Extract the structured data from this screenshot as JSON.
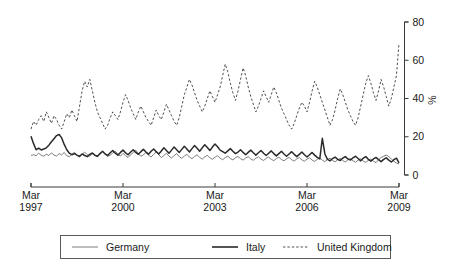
{
  "chart_data": {
    "type": "line",
    "title": "",
    "subtitle": "",
    "xlabel": "",
    "ylabel": "%",
    "ylim": [
      0,
      80
    ],
    "yticks": [
      0,
      20,
      40,
      60,
      80
    ],
    "ytick_labels": [
      "0",
      "20",
      "40",
      "60",
      "80"
    ],
    "xtick_labels": [
      "Mar\n1997",
      "Mar\n2000",
      "Mar\n2003",
      "Mar\n2006",
      "Mar\n2009"
    ],
    "xticks": [
      {
        "line1": "Mar",
        "line2": "1997",
        "index": 0
      },
      {
        "line1": "Mar",
        "line2": "2000",
        "index": 36
      },
      {
        "line1": "Mar",
        "line2": "2003",
        "index": 72
      },
      {
        "line1": "Mar",
        "line2": "2006",
        "index": 108
      },
      {
        "line1": "Mar",
        "line2": "2009",
        "index": 144
      }
    ],
    "x_start": "Mar 1997",
    "x_end": "Mar 2009",
    "x_frequency": "monthly",
    "n_points": 145,
    "grid": false,
    "legend_position": "bottom",
    "series": [
      {
        "name": "Germany",
        "color": "#6e6e6e",
        "style": "solid",
        "width": 0.9,
        "values": [
          10.2,
          10.6,
          10.1,
          11.4,
          10.3,
          9.8,
          10.9,
          10.2,
          11.6,
          10.4,
          9.9,
          11.2,
          10.5,
          11.8,
          10.1,
          9.6,
          10.8,
          11.9,
          10.3,
          9.4,
          10.7,
          12.0,
          10.6,
          9.8,
          11.1,
          10.2,
          9.5,
          10.9,
          12.2,
          11.0,
          9.7,
          10.4,
          11.5,
          12.4,
          10.8,
          9.9,
          11.3,
          10.1,
          9.2,
          10.6,
          11.8,
          13.0,
          11.2,
          9.8,
          10.5,
          11.9,
          10.3,
          9.4,
          10.8,
          12.1,
          10.6,
          9.1,
          10.2,
          11.4,
          9.8,
          8.9,
          10.1,
          11.2,
          9.6,
          8.7,
          9.9,
          10.8,
          9.4,
          8.5,
          9.7,
          10.5,
          9.2,
          8.3,
          9.5,
          10.3,
          9.0,
          8.2,
          9.3,
          10.1,
          8.8,
          8.0,
          9.1,
          9.9,
          8.6,
          7.9,
          9.0,
          9.7,
          8.5,
          7.8,
          8.9,
          9.6,
          8.4,
          7.7,
          8.8,
          9.5,
          8.3,
          7.6,
          8.7,
          9.4,
          8.2,
          7.5,
          8.6,
          9.3,
          8.1,
          7.4,
          8.5,
          9.2,
          8.0,
          7.3,
          8.4,
          9.1,
          7.9,
          7.2,
          8.3,
          9.0,
          7.8,
          7.1,
          8.2,
          8.9,
          7.7,
          7.0,
          8.1,
          8.8,
          7.6,
          6.9,
          8.0,
          8.7,
          7.5,
          6.8,
          7.9,
          8.6,
          7.4,
          6.7,
          7.8,
          8.5,
          7.3,
          6.6,
          7.7,
          8.4,
          7.2,
          6.5,
          8.0,
          9.2,
          9.8,
          10.4,
          9.6,
          8.4,
          7.2,
          6.2,
          5.8
        ]
      },
      {
        "name": "Italy",
        "color": "#2a2a2a",
        "style": "solid",
        "width": 1.5,
        "values": [
          20.2,
          16.4,
          13.2,
          14.0,
          13.1,
          13.6,
          14.2,
          15.6,
          17.4,
          19.0,
          20.6,
          21.2,
          19.4,
          16.0,
          13.2,
          11.4,
          10.6,
          11.2,
          10.4,
          9.8,
          11.0,
          10.2,
          9.6,
          10.8,
          11.5,
          10.4,
          9.8,
          11.2,
          12.4,
          11.0,
          10.2,
          11.6,
          12.8,
          11.4,
          10.4,
          11.8,
          13.0,
          11.6,
          10.6,
          12.0,
          13.2,
          11.8,
          10.8,
          12.2,
          13.4,
          12.0,
          10.9,
          12.4,
          13.6,
          12.2,
          11.0,
          12.6,
          14.2,
          12.8,
          11.4,
          13.0,
          14.6,
          13.2,
          11.8,
          13.4,
          15.0,
          13.6,
          12.0,
          13.8,
          15.4,
          14.0,
          12.4,
          14.2,
          15.8,
          14.4,
          12.8,
          14.6,
          16.2,
          14.8,
          13.0,
          12.2,
          11.4,
          12.6,
          13.8,
          12.4,
          11.2,
          12.0,
          13.2,
          11.8,
          10.6,
          11.8,
          13.0,
          11.6,
          10.4,
          11.6,
          12.8,
          11.4,
          10.2,
          11.4,
          12.6,
          11.2,
          10.0,
          11.2,
          12.4,
          11.0,
          9.8,
          11.0,
          12.2,
          10.8,
          9.6,
          10.8,
          12.0,
          10.6,
          9.4,
          10.6,
          11.8,
          10.4,
          9.2,
          8.4,
          19.2,
          11.0,
          8.2,
          7.4,
          8.6,
          9.4,
          8.2,
          7.6,
          8.8,
          9.6,
          8.4,
          7.8,
          9.0,
          9.8,
          8.6,
          7.4,
          8.8,
          9.6,
          8.2,
          7.2,
          8.4,
          9.2,
          8.0,
          7.0,
          8.2,
          9.0,
          7.8,
          6.8,
          8.0,
          8.8,
          6.4
        ]
      },
      {
        "name": "United Kingdom",
        "color": "#3a3a3a",
        "style": "dashed",
        "width": 0.9,
        "values": [
          24.0,
          28.0,
          26.0,
          29.0,
          31.0,
          28.0,
          33.0,
          30.0,
          27.0,
          31.0,
          29.0,
          26.0,
          24.0,
          28.0,
          32.0,
          30.0,
          34.0,
          31.0,
          28.0,
          36.0,
          44.0,
          49.0,
          46.0,
          50.0,
          44.0,
          38.0,
          33.0,
          30.0,
          27.0,
          24.0,
          26.0,
          30.0,
          33.0,
          31.0,
          29.0,
          33.0,
          38.0,
          42.0,
          39.0,
          35.0,
          32.0,
          29.0,
          33.0,
          36.0,
          33.0,
          30.0,
          28.0,
          26.0,
          30.0,
          34.0,
          31.0,
          29.0,
          33.0,
          37.0,
          34.0,
          31.0,
          28.0,
          26.0,
          30.0,
          36.0,
          42.0,
          46.0,
          50.0,
          47.0,
          43.0,
          39.0,
          36.0,
          33.0,
          36.0,
          40.0,
          44.0,
          41.0,
          38.0,
          42.0,
          46.0,
          52.0,
          58.0,
          54.0,
          48.0,
          43.0,
          39.0,
          44.0,
          50.0,
          56.0,
          52.0,
          46.0,
          41.0,
          37.0,
          33.0,
          36.0,
          40.0,
          44.0,
          41.0,
          38.0,
          42.0,
          46.0,
          43.0,
          39.0,
          35.0,
          32.0,
          29.0,
          26.0,
          24.0,
          27.0,
          31.0,
          35.0,
          38.0,
          36.0,
          33.0,
          38.0,
          44.0,
          49.0,
          46.0,
          42.0,
          38.0,
          34.0,
          30.0,
          26.0,
          29.0,
          34.0,
          40.0,
          45.0,
          42.0,
          38.0,
          34.0,
          31.0,
          28.0,
          26.0,
          30.0,
          36.0,
          42.0,
          48.0,
          52.0,
          48.0,
          43.0,
          39.0,
          44.0,
          50.0,
          46.0,
          41.0,
          36.0,
          40.0,
          46.0,
          52.0,
          69.0
        ]
      }
    ]
  },
  "legend": {
    "entries": [
      {
        "label": "Germany",
        "style": "solid-thin",
        "color": "#6e6e6e"
      },
      {
        "label": "Italy",
        "style": "solid-thick",
        "color": "#2a2a2a"
      },
      {
        "label": "United Kingdom",
        "style": "dashed",
        "color": "#3a3a3a"
      }
    ]
  },
  "colors": {
    "background": "#ffffff",
    "axis": "#3a3a3a",
    "text": "#1a1a1a",
    "legend_border": "#5a5a5a"
  }
}
